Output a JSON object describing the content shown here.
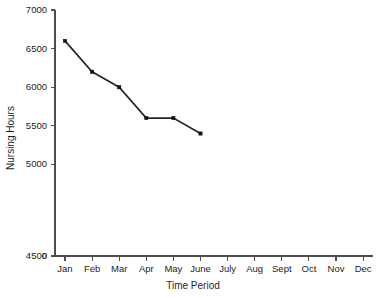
{
  "chart_data": {
    "type": "line",
    "title": "",
    "xlabel": "Time Period",
    "ylabel": "Nursing Hours",
    "categories": [
      "Jan",
      "Feb",
      "Mar",
      "Apr",
      "May",
      "June",
      "July",
      "Aug",
      "Sept",
      "Oct",
      "Nov",
      "Dec"
    ],
    "values": [
      6600,
      6200,
      6000,
      5600,
      5600,
      5400,
      null,
      null,
      null,
      null,
      null,
      null
    ],
    "series": [
      {
        "name": "Nursing Hours",
        "points": [
          {
            "x": "Jan",
            "y": 6600
          },
          {
            "x": "Feb",
            "y": 6200
          },
          {
            "x": "Mar",
            "y": 6000
          },
          {
            "x": "Apr",
            "y": 5600
          },
          {
            "x": "May",
            "y": 5600
          },
          {
            "x": "June",
            "y": 5400
          }
        ]
      }
    ],
    "yticks": [
      0,
      4500,
      5000,
      5500,
      6000,
      6500,
      7000
    ],
    "ytick_labels": [
      "0",
      "4500",
      "5000",
      "5500",
      "6000",
      "6500",
      "7000"
    ],
    "ylim": [
      4350,
      7000
    ],
    "axis_break": true,
    "grid": false,
    "legend": false,
    "legend_position": "none",
    "line_color": "#262626",
    "marker_color": "#111111",
    "marker_shape": "square",
    "axis_color": "#4d4d4d",
    "background_color": "#ffffff"
  }
}
